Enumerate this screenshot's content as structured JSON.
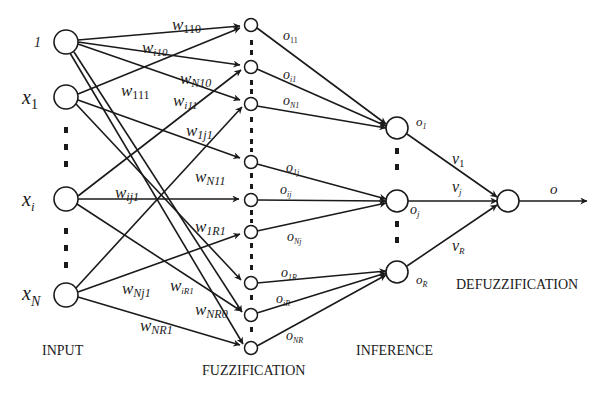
{
  "colors": {
    "stroke": "#1a1a1a",
    "background": "#ffffff"
  },
  "layers": {
    "input": {
      "caption": "INPUT"
    },
    "fuzzification": {
      "caption": "FUZZIFICATION"
    },
    "inference": {
      "caption": "INFERENCE"
    },
    "defuzzification": {
      "caption": "DEFUZZIFICATION"
    }
  },
  "input_nodes": [
    {
      "label": "1",
      "sub": ""
    },
    {
      "label": "x",
      "sub": "1"
    },
    {
      "label": "x",
      "sub": "i"
    },
    {
      "label": "x",
      "sub": "N"
    }
  ],
  "weights": [
    {
      "base": "w",
      "sub": "110"
    },
    {
      "base": "w",
      "sub": "i10"
    },
    {
      "base": "w",
      "sub": "N10"
    },
    {
      "base": "w",
      "sub": "111"
    },
    {
      "base": "w",
      "sub": "i11"
    },
    {
      "base": "w",
      "sub": "1j1"
    },
    {
      "base": "w",
      "sub": "N11"
    },
    {
      "base": "w",
      "sub": "ij1"
    },
    {
      "base": "w",
      "sub": "1R1"
    },
    {
      "base": "w",
      "sub": "Nj1"
    },
    {
      "base": "w",
      "sub": "iR1"
    },
    {
      "base": "w",
      "sub": "NR0"
    },
    {
      "base": "w",
      "sub": "NR1"
    }
  ],
  "fuzz_outputs": [
    {
      "base": "o",
      "sub": "11"
    },
    {
      "base": "o",
      "sub": "i1"
    },
    {
      "base": "o",
      "sub": "N1"
    },
    {
      "base": "o",
      "sub": "1j"
    },
    {
      "base": "o",
      "sub": "ij"
    },
    {
      "base": "o",
      "sub": "Nj"
    },
    {
      "base": "o",
      "sub": "1R"
    },
    {
      "base": "o",
      "sub": "iR"
    },
    {
      "base": "o",
      "sub": "NR"
    }
  ],
  "inference_nodes": [
    {
      "base": "o",
      "sub": "1"
    },
    {
      "base": "o",
      "sub": "j"
    },
    {
      "base": "o",
      "sub": "R"
    }
  ],
  "defuzz_weights": [
    {
      "base": "v",
      "sub": "1"
    },
    {
      "base": "v",
      "sub": "j"
    },
    {
      "base": "v",
      "sub": "R"
    }
  ],
  "output": {
    "label": "o"
  }
}
